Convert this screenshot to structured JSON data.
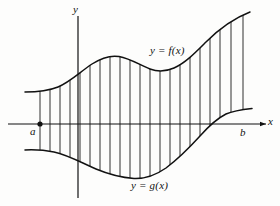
{
  "figure": {
    "axes": {
      "x_label": "x",
      "y_label": "y",
      "x_axis_y_px": 124,
      "y_axis_x_px": 78
    },
    "bounds": {
      "left_label": "a",
      "right_label": "b",
      "left_x_px": 40,
      "right_x_px": 243
    },
    "curves": [
      {
        "name": "upper-curve",
        "label": "y = f(x)",
        "path": "M 25,92 C 38,92 48,91 58,87 C 70,82 80,72 92,64 C 102,57.5 110,55 119,56.5 C 130,58.5 140,65 150,69 C 158,72 166,71.5 174,68 C 186,62.5 196,52 206,42 C 218,30 232,19 250,12"
      },
      {
        "name": "lower-curve",
        "label": "y = g(x)",
        "path": "M 25,150 C 36,149.5 44,150 54,152 C 68,155 82,163 96,169 C 108,174 120,177.5 134,178.5 C 146,179 156,175 166,168 C 178,159 190,147 200,136 C 208,127 216,119 226,114 C 234,110.5 243,109.5 252,108.5"
      }
    ],
    "hatch": {
      "style": "vertical-lines",
      "spacing_px": 10,
      "count": 21,
      "color": "#1a1a1a"
    },
    "colors": {
      "ink": "#111111",
      "background": "#fdfdfc"
    }
  }
}
